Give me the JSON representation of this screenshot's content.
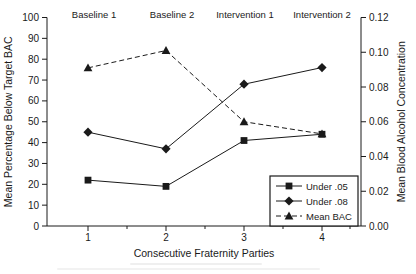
{
  "chart_data": {
    "type": "line",
    "x": [
      1,
      2,
      3,
      4
    ],
    "xlabel": "Consecutive Fraternity Parties",
    "ylabel_left": "Mean Percentage Below Target BAC",
    "ylabel_right": "Mean Blood Alcohol Concentration",
    "ylim_left": [
      0,
      100
    ],
    "ylim_right": [
      0,
      0.12
    ],
    "yticks_left": [
      "0",
      "10",
      "20",
      "30",
      "40",
      "50",
      "60",
      "70",
      "80",
      "90",
      "100"
    ],
    "yticks_right": [
      "0.00",
      "0.02",
      "0.04",
      "0.06",
      "0.08",
      "0.10",
      "0.12"
    ],
    "xticks": [
      "1",
      "2",
      "3",
      "4"
    ],
    "phase_labels": [
      "Baseline 1",
      "Baseline 2",
      "Intervention 1",
      "Intervention 2"
    ],
    "series": [
      {
        "name": "Under .05",
        "axis": "left",
        "marker": "square",
        "line": "solid",
        "values": [
          22,
          19,
          41,
          44
        ]
      },
      {
        "name": "Under .08",
        "axis": "left",
        "marker": "diamond",
        "line": "solid",
        "values": [
          45,
          37,
          68,
          76
        ]
      },
      {
        "name": "Mean BAC",
        "axis": "right",
        "marker": "triangle",
        "line": "dashed",
        "values": [
          0.091,
          0.101,
          0.06,
          0.053
        ]
      }
    ],
    "legend_position": "bottom-right",
    "grid": false,
    "ink_color": "#1a1a1a",
    "background_color": "#ffffff"
  }
}
